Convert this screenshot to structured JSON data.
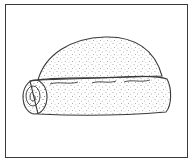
{
  "illustration": {
    "subject": "rolled pastry / bread roll line drawing",
    "stroke_color": "#3a3a3a",
    "stipple_color": "#555555",
    "background": "#ffffff"
  }
}
